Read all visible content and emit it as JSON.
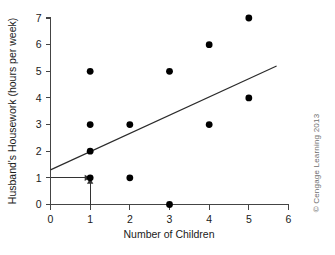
{
  "figure": {
    "credit": "© Cengage Learning 2013"
  },
  "chart_data": {
    "type": "scatter",
    "title": "",
    "xlabel": "Number of Children",
    "ylabel": "Husband's Housework (hours per week)",
    "xlim": [
      0,
      6
    ],
    "ylim": [
      0,
      7
    ],
    "xticks": [
      0,
      1,
      2,
      3,
      4,
      5,
      6
    ],
    "xtick_labels": [
      "0",
      "1",
      "2",
      "3",
      "4",
      "5",
      "6"
    ],
    "yticks": [
      0,
      1,
      2,
      3,
      4,
      5,
      6,
      7
    ],
    "ytick_labels": [
      "0",
      "1",
      "2",
      "3",
      "4",
      "5",
      "6",
      "7"
    ],
    "grid": false,
    "legend": "none",
    "points": [
      {
        "x": 1,
        "y": 5
      },
      {
        "x": 1,
        "y": 3
      },
      {
        "x": 1,
        "y": 2
      },
      {
        "x": 1,
        "y": 1
      },
      {
        "x": 2,
        "y": 3
      },
      {
        "x": 2,
        "y": 1
      },
      {
        "x": 3,
        "y": 5
      },
      {
        "x": 3,
        "y": 0
      },
      {
        "x": 4,
        "y": 6
      },
      {
        "x": 4,
        "y": 3
      },
      {
        "x": 5,
        "y": 7
      },
      {
        "x": 5,
        "y": 4
      }
    ],
    "regression_line": {
      "x_start": 0,
      "y_start": 1.3,
      "x_end": 5.7,
      "y_end": 5.2
    },
    "annotations": [
      {
        "name": "horizontal-prediction-arrow",
        "from": {
          "x": 0,
          "y": 1
        },
        "to": {
          "x": 1,
          "y": 1
        },
        "direction": "right"
      },
      {
        "name": "vertical-prediction-arrow",
        "from": {
          "x": 1,
          "y": 0
        },
        "to": {
          "x": 1,
          "y": 1
        },
        "direction": "up"
      }
    ]
  }
}
